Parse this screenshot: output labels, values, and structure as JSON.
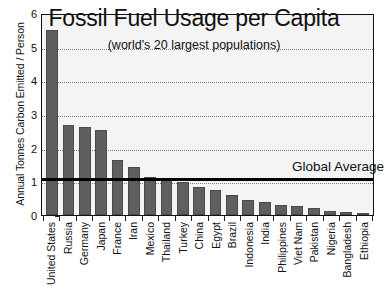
{
  "chart_data": {
    "type": "bar",
    "title": "Fossil Fuel Usage per Capita",
    "subtitle": "(world's 20 largest populations)",
    "xlabel": "",
    "ylabel": "Annual Tonnes Carbon Emitted / Person",
    "ylim": [
      0,
      6
    ],
    "yticks": [
      0,
      1,
      2,
      3,
      4,
      5,
      6
    ],
    "ytick_labels": [
      "0",
      "1",
      "2",
      "3",
      "4",
      "5",
      "6"
    ],
    "grid": true,
    "grid_style": "dotted-horizontal",
    "legend": "none",
    "bar_color": "#5f5f5f",
    "plot_background": "#f4f4f4",
    "categories": [
      "United States",
      "Russia",
      "Germany",
      "Japan",
      "France",
      "Iran",
      "Mexico",
      "Thailand",
      "Turkey",
      "China",
      "Egypt",
      "Brazil",
      "Indonesia",
      "India",
      "Philippines",
      "Viet Nam",
      "Pakistan",
      "Nigeria",
      "Bangladesh",
      "Ethiopia"
    ],
    "values": [
      5.55,
      2.7,
      2.65,
      2.55,
      1.65,
      1.45,
      1.15,
      1.05,
      1.0,
      0.85,
      0.75,
      0.6,
      0.45,
      0.4,
      0.3,
      0.28,
      0.22,
      0.13,
      0.08,
      0.03
    ],
    "annotations": [
      {
        "name": "global-average",
        "label": "Global Average",
        "value": 1.15,
        "type": "horizontal-line",
        "color": "#000000"
      }
    ]
  }
}
